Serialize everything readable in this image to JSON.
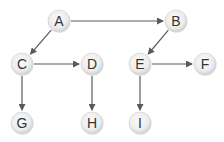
{
  "diagram": {
    "type": "directed-tree",
    "colors": {
      "node_fill_center": "#fbfbfb",
      "node_fill_edge": "#cfcfcf",
      "node_stroke": "#d6d6d6",
      "label": "#333333",
      "edge": "#5a5a5a",
      "background": "#ffffff"
    },
    "node_radius": 11,
    "nodes": [
      {
        "id": "A",
        "label": "A",
        "x": 59,
        "y": 21
      },
      {
        "id": "B",
        "label": "B",
        "x": 176,
        "y": 21
      },
      {
        "id": "C",
        "label": "C",
        "x": 22,
        "y": 64
      },
      {
        "id": "D",
        "label": "D",
        "x": 92,
        "y": 64
      },
      {
        "id": "E",
        "label": "E",
        "x": 140,
        "y": 64
      },
      {
        "id": "F",
        "label": "F",
        "x": 205,
        "y": 64
      },
      {
        "id": "G",
        "label": "G",
        "x": 22,
        "y": 123
      },
      {
        "id": "H",
        "label": "H",
        "x": 92,
        "y": 123
      },
      {
        "id": "I",
        "label": "I",
        "x": 140,
        "y": 123
      }
    ],
    "edges": [
      {
        "from": "A",
        "to": "B"
      },
      {
        "from": "A",
        "to": "C"
      },
      {
        "from": "B",
        "to": "E"
      },
      {
        "from": "C",
        "to": "D"
      },
      {
        "from": "C",
        "to": "G"
      },
      {
        "from": "D",
        "to": "H"
      },
      {
        "from": "E",
        "to": "F"
      },
      {
        "from": "E",
        "to": "I"
      }
    ]
  }
}
